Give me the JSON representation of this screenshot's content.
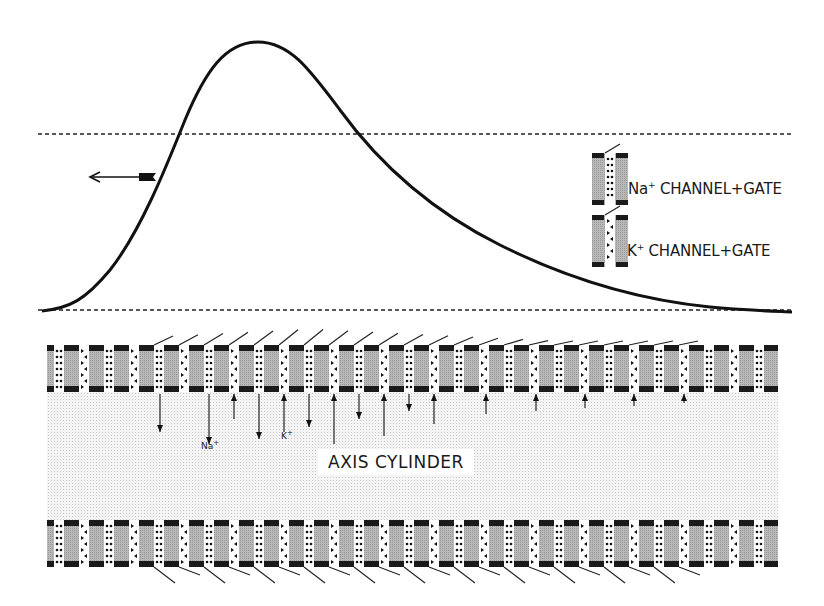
{
  "figure": {
    "type": "action-potential-membrane-diagram",
    "curve": {
      "description": "Action potential waveform propagating leftward",
      "baseline_y": 310,
      "threshold_y": 134,
      "peak": {
        "x": 258,
        "y": 42
      },
      "direction_arrow": "left"
    },
    "legend": [
      {
        "ion": "Na",
        "superscript": "+",
        "label": "CHANNEL+GATE",
        "symbol": "dots"
      },
      {
        "ion": "K",
        "superscript": "+",
        "label": "CHANNEL+GATE",
        "symbol": "triangles"
      }
    ],
    "ion_labels": {
      "na": "Na",
      "na_sup": "+",
      "k": "K",
      "k_sup": "+"
    },
    "axis_label": "AXIS CYLINDER",
    "colors": {
      "line": "#111111",
      "membrane_fill": "#b5b5b5",
      "membrane_cap": "#1a1a1a",
      "interior_stipple": "#e9e9e9",
      "background": "#ffffff"
    },
    "membrane": {
      "left_x": 47,
      "right_x": 778,
      "channel_period": 25,
      "top_y": 345,
      "bottom_y": 392,
      "lower_top_y": 520,
      "lower_bottom_y": 567
    },
    "flux_arrows": [
      {
        "x": 160,
        "dir": "down",
        "len": 38
      },
      {
        "x": 209,
        "dir": "down",
        "len": 50,
        "label": "na"
      },
      {
        "x": 234,
        "dir": "up",
        "len": 25
      },
      {
        "x": 259,
        "dir": "down",
        "len": 45
      },
      {
        "x": 284,
        "dir": "up",
        "len": 38,
        "label": "k"
      },
      {
        "x": 309,
        "dir": "down",
        "len": 33
      },
      {
        "x": 334,
        "dir": "up",
        "len": 50
      },
      {
        "x": 359,
        "dir": "down",
        "len": 25
      },
      {
        "x": 384,
        "dir": "up",
        "len": 42
      },
      {
        "x": 409,
        "dir": "down",
        "len": 17
      },
      {
        "x": 434,
        "dir": "up",
        "len": 30
      },
      {
        "x": 486,
        "dir": "up",
        "len": 20
      },
      {
        "x": 536,
        "dir": "up",
        "len": 17
      },
      {
        "x": 585,
        "dir": "up",
        "len": 14
      },
      {
        "x": 634,
        "dir": "up",
        "len": 12
      },
      {
        "x": 684,
        "dir": "up",
        "len": 9
      }
    ]
  }
}
